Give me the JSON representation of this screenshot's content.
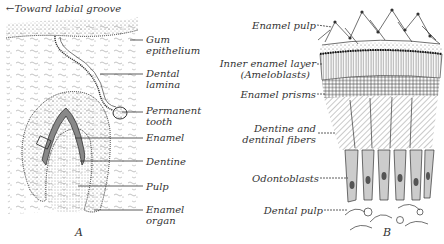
{
  "panel_a": {
    "top_label": "←Toward labial groove",
    "labels": {
      "gum_epithelium_1": "Gum",
      "gum_epithelium_2": "epithelium",
      "dental_lamina_1": "Dental",
      "dental_lamina_2": "lamina",
      "permanent_tooth_1": "Permanent",
      "permanent_tooth_2": "tooth",
      "enamel": "Enamel",
      "dentine": "Dentine",
      "pulp": "Pulp",
      "enamel_organ_1": "Enamel",
      "enamel_organ_2": "organ"
    },
    "letter": "A"
  },
  "panel_b": {
    "labels": {
      "enamel_pulp": "Enamel pulp",
      "inner_enamel_layer": "Inner enamel layer",
      "ameloblasts": "(Ameloblasts)",
      "enamel_prisms": "Enamel prisms",
      "dentine_1": "Dentine and",
      "dentine_2": "dentinal fibers",
      "odontoblasts": "Odontoblasts",
      "dental_pulp": "Dental pulp"
    },
    "letter": "B"
  },
  "colors": {
    "ink": "#333333",
    "background": "#ffffff"
  }
}
